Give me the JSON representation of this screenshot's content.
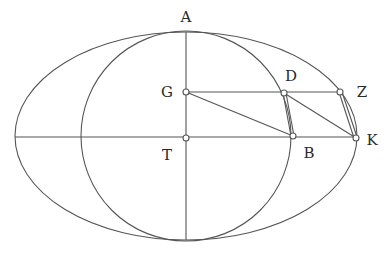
{
  "figure": {
    "stroke_color": "#555555",
    "ellipse": {
      "cx": 186,
      "cy": 136,
      "rx": 171,
      "ry": 104
    },
    "circle": {
      "cx": 186,
      "cy": 136,
      "r": 105
    },
    "points": {
      "A": {
        "label": "A",
        "x": 186,
        "y": 32,
        "lx": 186,
        "ly": 22
      },
      "G": {
        "label": "G",
        "x": 186,
        "y": 92,
        "lx": 167,
        "ly": 97
      },
      "T": {
        "label": "T",
        "x": 186,
        "y": 138,
        "lx": 167,
        "ly": 160
      },
      "D": {
        "label": "D",
        "x": 284,
        "y": 93,
        "lx": 291,
        "ly": 81
      },
      "Z": {
        "label": "Z",
        "x": 340,
        "y": 92,
        "lx": 362,
        "ly": 97
      },
      "B": {
        "label": "B",
        "x": 293,
        "y": 136,
        "lx": 309,
        "ly": 158
      },
      "K": {
        "label": "K",
        "x": 356,
        "y": 138,
        "lx": 372,
        "ly": 145
      }
    }
  }
}
